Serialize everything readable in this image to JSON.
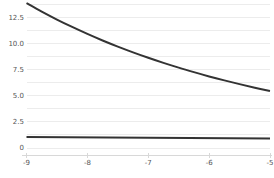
{
  "chart_data": {
    "type": "line",
    "title": "",
    "subtitle": "",
    "xlabel": "",
    "ylabel": "",
    "xlim": [
      -9,
      -5
    ],
    "ylim": [
      0,
      13.9
    ],
    "grid": true,
    "legend": null,
    "legend_position": "none",
    "background_color": "#ffffff",
    "grid_color": "#ececec",
    "axis_color": "#d8d8d8",
    "tick_label_color": "#555555",
    "x_ticks": [
      "-9",
      "-8",
      "-7",
      "-6",
      "-5"
    ],
    "x_tick_values": [
      -9,
      -8,
      -7,
      -6,
      -5
    ],
    "y_ticks": [
      "0",
      "2.5",
      "5.0",
      "7.5",
      "10.0",
      "12.5"
    ],
    "y_tick_values": [
      0,
      2.5,
      5.0,
      7.5,
      10.0,
      12.5
    ],
    "series": [
      {
        "name": "decay-curve",
        "color": "#333333",
        "linewidth": 2.0,
        "x": [
          -9.0,
          -8.75,
          -8.5,
          -8.25,
          -8.0,
          -7.75,
          -7.5,
          -7.25,
          -7.0,
          -6.75,
          -6.5,
          -6.25,
          -6.0,
          -5.75,
          -5.5,
          -5.25,
          -5.0
        ],
        "values": [
          13.9,
          13.09,
          12.33,
          11.62,
          10.95,
          10.32,
          9.73,
          9.18,
          8.66,
          8.17,
          7.71,
          7.28,
          6.87,
          6.49,
          6.13,
          5.79,
          5.47
        ]
      },
      {
        "name": "flat-line",
        "color": "#333333",
        "linewidth": 2.0,
        "x": [
          -9.0,
          -5.0
        ],
        "values": [
          1.06,
          0.9
        ]
      }
    ]
  }
}
